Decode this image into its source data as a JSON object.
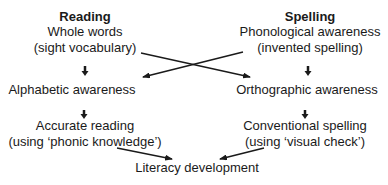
{
  "reading": {
    "title": "Reading",
    "stage1_line1": "Whole words",
    "stage1_line2": "(sight vocabulary)",
    "stage2": "Alphabetic awareness",
    "stage3_line1": "Accurate reading",
    "stage3_line2": "(using ‘phonic knowledge’)"
  },
  "spelling": {
    "title": "Spelling",
    "stage1_line1": "Phonological awareness",
    "stage1_line2": "(invented spelling)",
    "stage2": "Orthographic awareness",
    "stage3_line1": "Conventional spelling",
    "stage3_line2": "(using ‘visual check’)"
  },
  "outcome": "Literacy development",
  "colors": {
    "text": "#1a1a1a",
    "arrow": "#1a1a1a",
    "background": "#ffffff"
  }
}
